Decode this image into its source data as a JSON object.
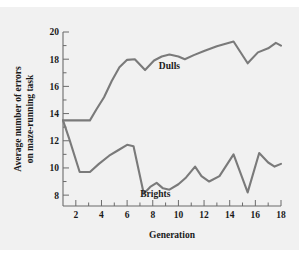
{
  "chart_data": {
    "type": "line",
    "title": "",
    "xlabel": "Generation",
    "ylabel": "Average number of errors on maze-running task",
    "ylabel_line1": "Average number of errors",
    "ylabel_line2": "on maze-running task",
    "xlim": [
      1,
      18
    ],
    "ylim": [
      7.2,
      20
    ],
    "grid": false,
    "legend_position": "inline-annotation",
    "xticks": [
      2,
      4,
      6,
      8,
      10,
      12,
      14,
      16,
      18
    ],
    "xtick_labels": [
      "2",
      "4",
      "6",
      "8",
      "10",
      "12",
      "14",
      "16",
      "18"
    ],
    "xminor_ticks": [
      3,
      5,
      7,
      9,
      11,
      13,
      15,
      17
    ],
    "yticks": [
      8,
      10,
      12,
      14,
      16,
      18,
      20
    ],
    "ytick_labels": [
      "8",
      "10",
      "12",
      "14",
      "16",
      "18",
      "20"
    ],
    "yminor_ticks": [
      9,
      11,
      13,
      15,
      17,
      19
    ],
    "line_color": "#7a7a7a",
    "axis_color": "#6b6b6b",
    "background_color": "#f1f1f1",
    "series": [
      {
        "name": "Dulls",
        "label": "Dulls",
        "label_x": 9.3,
        "label_y": 17.25,
        "x": [
          1.0,
          3.1,
          3.6,
          4.2,
          4.8,
          5.4,
          6.0,
          6.6,
          7.4,
          8.1,
          8.7,
          9.3,
          10.0,
          10.5,
          11.2,
          12.0,
          13.0,
          14.3,
          15.4,
          16.2,
          17.0,
          17.6,
          18.0
        ],
        "values": [
          13.5,
          13.5,
          14.3,
          15.2,
          16.4,
          17.4,
          17.95,
          18.0,
          17.2,
          17.9,
          18.2,
          18.35,
          18.2,
          18.0,
          18.3,
          18.6,
          18.95,
          19.3,
          17.7,
          18.5,
          18.8,
          19.2,
          19.0
        ]
      },
      {
        "name": "Brights",
        "label": "Brights",
        "label_x": 8.2,
        "label_y": 7.85,
        "x": [
          1.0,
          1.5,
          2.3,
          3.1,
          3.8,
          4.6,
          5.3,
          6.0,
          6.5,
          7.3,
          7.8,
          8.3,
          8.8,
          9.3,
          10.0,
          10.6,
          11.3,
          11.8,
          12.4,
          13.2,
          14.3,
          15.4,
          16.3,
          17.0,
          17.5,
          18.0
        ],
        "values": [
          13.5,
          12.1,
          9.7,
          9.7,
          10.3,
          10.9,
          11.3,
          11.7,
          11.6,
          8.1,
          8.6,
          8.9,
          8.5,
          8.4,
          8.8,
          9.3,
          10.1,
          9.4,
          9.0,
          9.4,
          11.0,
          8.2,
          11.1,
          10.4,
          10.1,
          10.3
        ]
      }
    ]
  }
}
